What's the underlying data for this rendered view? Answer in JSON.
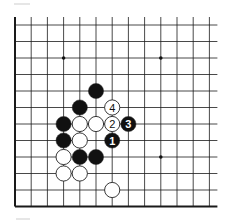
{
  "diagram": {
    "grid": {
      "origin_x": 15,
      "origin_y": 25,
      "spacing_x": 16.2,
      "spacing_y": 16.5,
      "cols": 13,
      "rows": 12,
      "open_edges": [
        "top",
        "right"
      ],
      "line_color": "#1a1a1a",
      "edge_color": "#111111"
    },
    "star_points": [
      {
        "col": 3,
        "row": 2
      },
      {
        "col": 9,
        "row": 2
      },
      {
        "col": 9,
        "row": 8
      }
    ],
    "stones": [
      {
        "col": 5,
        "row": 4,
        "color": "black",
        "label": ""
      },
      {
        "col": 4,
        "row": 5,
        "color": "black",
        "label": ""
      },
      {
        "col": 6,
        "row": 5,
        "color": "white",
        "label": "4"
      },
      {
        "col": 3,
        "row": 6,
        "color": "black",
        "label": ""
      },
      {
        "col": 4,
        "row": 6,
        "color": "white",
        "label": ""
      },
      {
        "col": 5,
        "row": 6,
        "color": "white",
        "label": ""
      },
      {
        "col": 6,
        "row": 6,
        "color": "white",
        "label": "2"
      },
      {
        "col": 7,
        "row": 6,
        "color": "black",
        "label": "3"
      },
      {
        "col": 3,
        "row": 7,
        "color": "black",
        "label": ""
      },
      {
        "col": 4,
        "row": 7,
        "color": "white",
        "label": ""
      },
      {
        "col": 6,
        "row": 7,
        "color": "black",
        "label": "1"
      },
      {
        "col": 3,
        "row": 8,
        "color": "white",
        "label": ""
      },
      {
        "col": 4,
        "row": 8,
        "color": "black",
        "label": ""
      },
      {
        "col": 5,
        "row": 8,
        "color": "black",
        "label": ""
      },
      {
        "col": 3,
        "row": 9,
        "color": "white",
        "label": ""
      },
      {
        "col": 4,
        "row": 9,
        "color": "white",
        "label": ""
      },
      {
        "col": 6,
        "row": 10,
        "color": "white",
        "label": ""
      }
    ],
    "colors": {
      "black_stone": "#111111",
      "white_stone": "#ffffff",
      "stone_outline": "#222222",
      "background": "#ffffff"
    }
  }
}
